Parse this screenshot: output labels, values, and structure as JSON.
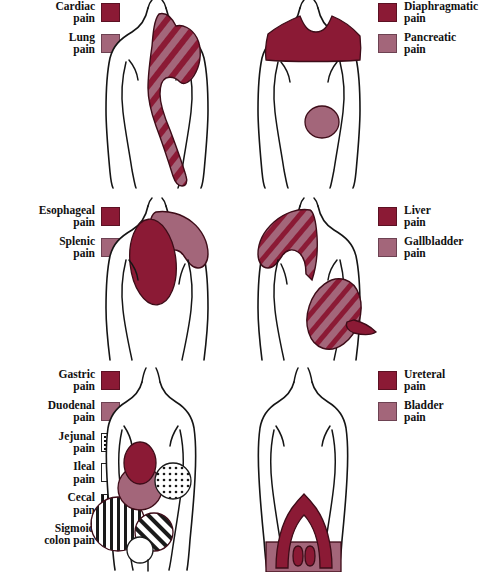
{
  "diagram": {
    "rows": [
      {
        "id": "row-1",
        "legend_left": {
          "items": [
            {
              "label": "Cardiac\npain",
              "swatch": "solid-dark",
              "color": "#8B1A35"
            },
            {
              "label": "Lung\npain",
              "swatch": "solid-light",
              "color": "#A3667A"
            }
          ]
        },
        "legend_right": {
          "items": [
            {
              "label": "Diaphragmatic\npain",
              "swatch": "solid-dark",
              "color": "#8B1A35"
            },
            {
              "label": "Pancreatic\npain",
              "swatch": "solid-light",
              "color": "#A3667A"
            }
          ]
        },
        "figure_left": {
          "name": "torso-cardiac-lung",
          "regions": [
            "left chest",
            "left shoulder",
            "left arm"
          ]
        },
        "figure_right": {
          "name": "torso-diaphragmatic-pancreatic",
          "regions": [
            "shoulder band",
            "mid abdomen"
          ]
        }
      },
      {
        "id": "row-2",
        "legend_left": {
          "items": [
            {
              "label": "Esophageal\npain",
              "swatch": "solid-dark",
              "color": "#8B1A35"
            },
            {
              "label": "Splenic\npain",
              "swatch": "solid-light",
              "color": "#A3667A"
            }
          ]
        },
        "legend_right": {
          "items": [
            {
              "label": "Liver\npain",
              "swatch": "solid-dark",
              "color": "#8B1A35"
            },
            {
              "label": "Gallbladder\npain",
              "swatch": "solid-light",
              "color": "#A3667A"
            }
          ]
        },
        "figure_left": {
          "name": "torso-esophageal-splenic",
          "regions": [
            "central chest",
            "left shoulder"
          ]
        },
        "figure_right": {
          "name": "torso-liver-gallbladder",
          "regions": [
            "right shoulder",
            "right flank"
          ]
        }
      },
      {
        "id": "row-3",
        "legend_left": {
          "items": [
            {
              "label": "Gastric\npain",
              "swatch": "solid-dark",
              "color": "#8B1A35"
            },
            {
              "label": "Duodenal\npain",
              "swatch": "solid-light",
              "color": "#A3667A"
            },
            {
              "label": "Jejunal\npain",
              "swatch": "dots",
              "color": "#ffffff"
            },
            {
              "label": "Ileal\npain",
              "swatch": "empty",
              "color": "#ffffff"
            },
            {
              "label": "Cecal\npain",
              "swatch": "vertical-bars",
              "color": "#ffffff"
            },
            {
              "label": "Sigmoid\ncolon pain",
              "swatch": "diagonal-stripes",
              "color": "#ffffff"
            }
          ]
        },
        "legend_right": {
          "items": [
            {
              "label": "Ureteral\npain",
              "swatch": "solid-dark",
              "color": "#8B1A35"
            },
            {
              "label": "Bladder\npain",
              "swatch": "solid-light",
              "color": "#A3667A"
            }
          ]
        },
        "figure_left": {
          "name": "torso-gi-tract",
          "regions": [
            "epigastric",
            "periumbilical",
            "right lower quadrant",
            "left lower quadrant"
          ]
        },
        "figure_right": {
          "name": "torso-ureteral-bladder",
          "regions": [
            "flank to groin",
            "suprapubic"
          ]
        }
      }
    ]
  }
}
